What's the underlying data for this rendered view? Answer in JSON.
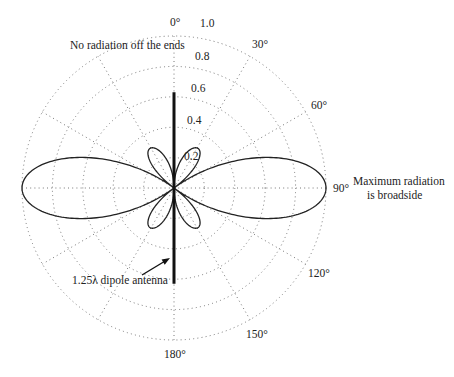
{
  "chart_data": {
    "type": "polar",
    "title": "",
    "pattern": "1.25-wavelength dipole radiation pattern",
    "dipole_length_wavelengths": 1.25,
    "angle_ticks": [
      {
        "deg": 0,
        "label": "0°"
      },
      {
        "deg": 30,
        "label": "30°"
      },
      {
        "deg": 60,
        "label": "60°"
      },
      {
        "deg": 90,
        "label": "90°"
      },
      {
        "deg": 120,
        "label": "120°"
      },
      {
        "deg": 150,
        "label": "150°"
      },
      {
        "deg": 180,
        "label": "180°"
      }
    ],
    "radial_ticks": [
      {
        "value": 0.2,
        "label": "0.2"
      },
      {
        "value": 0.4,
        "label": "0.4"
      },
      {
        "value": 0.6,
        "label": "0.6"
      },
      {
        "value": 0.8,
        "label": "0.8"
      },
      {
        "value": 1.0,
        "label": "1.0"
      }
    ],
    "rlim": [
      0,
      1.0
    ],
    "grid": true,
    "main_lobe": {
      "direction_deg": 90,
      "value": 1.0
    },
    "minor_lobes": {
      "direction_deg": [
        35,
        145
      ],
      "value": 0.32
    },
    "antenna_extent": 0.63,
    "annotations": {
      "ends": "No radiation off the ends",
      "broadside_line1": "Maximum radiation",
      "broadside_line2": "is broadside",
      "antenna": "1.25λ dipole antenna"
    }
  }
}
